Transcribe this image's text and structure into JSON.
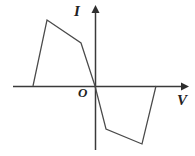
{
  "figure": {
    "background_color": "#ffffff",
    "line_color": "#4a4a4a",
    "axis_color": "#3a3a3a",
    "labels": {
      "y_axis": "I",
      "x_axis": "V",
      "origin": "O"
    }
  },
  "chart_data": {
    "type": "line",
    "title": "",
    "xlabel": "V",
    "ylabel": "I",
    "grid": false,
    "legend": null,
    "axes": {
      "x_axis_pixel_y": 86,
      "y_axis_pixel_x": 95,
      "x_range_pixels": [
        13,
        183
      ],
      "y_range_pixels": [
        8,
        150
      ],
      "x_ticks": [],
      "y_ticks": [],
      "tick_labels": []
    },
    "series": [
      {
        "name": "I-V characteristic",
        "points_pixels": [
          [
            33,
            86
          ],
          [
            47,
            20
          ],
          [
            81,
            43
          ],
          [
            95,
            86
          ],
          [
            106,
            129
          ],
          [
            142,
            144
          ],
          [
            156,
            86
          ]
        ],
        "points_normalized": [
          [
            -1.0,
            0.0
          ],
          [
            -0.85,
            0.85
          ],
          [
            -0.45,
            0.55
          ],
          [
            0.0,
            0.0
          ],
          [
            0.12,
            -0.55
          ],
          [
            0.53,
            -0.74
          ],
          [
            0.7,
            0.0
          ]
        ],
        "description": "Antisymmetric S-shaped polyline: rises steeply from negative V axis crossing to a positive peak, falls gently to a shoulder, drops steeply through the origin to a negative trough, then rises back to the V axis."
      }
    ]
  }
}
